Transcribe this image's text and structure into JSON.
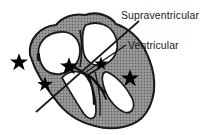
{
  "figure": {
    "background_color": "#ffffff",
    "width": 220,
    "height": 135
  },
  "labels": {
    "supraventricular": "Supraventricular",
    "ventricular": "Ventricular"
  },
  "colors": {
    "outline": "#1a1a1a",
    "myocardium_fill": "#8c8c8c",
    "chamber_fill": "#ffffff",
    "marker": "#000000",
    "text": "#1a1a1a",
    "divider_line": "#1a1a1a"
  },
  "markers": {
    "icon": "star-icon",
    "count": 5,
    "items": [
      {
        "name": "star-marker-left-outer",
        "x": 19,
        "y": 62,
        "size": 9
      },
      {
        "name": "star-marker-left-lower",
        "x": 45,
        "y": 84,
        "size": 8
      },
      {
        "name": "star-marker-center-av-node",
        "x": 69,
        "y": 66,
        "size": 9
      },
      {
        "name": "star-marker-right-ventricle",
        "x": 130,
        "y": 78,
        "size": 9
      },
      {
        "name": "star-marker-septum-upper",
        "x": 101,
        "y": 62,
        "size": 7
      }
    ]
  },
  "annotations": {
    "divider": {
      "name": "supraventricular-ventricular-divider",
      "x1": 36,
      "y1": 112,
      "x2": 139,
      "y2": 21
    },
    "leader_line": {
      "name": "ventricular-leader-line",
      "x1": 86,
      "y1": 72,
      "x2": 126,
      "y2": 45
    },
    "ostium_mark": {
      "name": "ostium-mark",
      "x": 38,
      "y": 57
    }
  },
  "conduction_system": {
    "name": "conduction-system",
    "elements": [
      "av-node",
      "bundle-of-his",
      "left-bundle-branch",
      "right-bundle-branch"
    ]
  }
}
